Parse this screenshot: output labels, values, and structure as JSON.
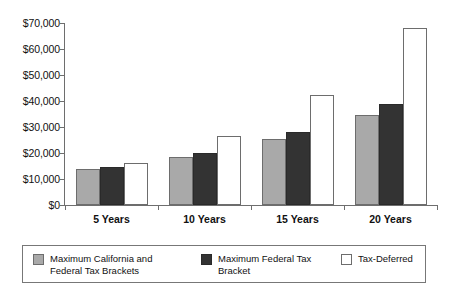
{
  "chart_data": {
    "type": "bar",
    "title": "",
    "subtitle": "",
    "xlabel": "",
    "ylabel": "",
    "categories": [
      "5 Years",
      "10 Years",
      "15 Years",
      "20 Years"
    ],
    "series": [
      {
        "name": "Maximum California and Federal Tax Brackets",
        "color": "#a9a9a9",
        "values": [
          14000,
          18500,
          25500,
          34700
        ]
      },
      {
        "name": "Maximum Federal Tax Bracket",
        "color": "#333333",
        "values": [
          14500,
          20000,
          28000,
          38800
        ]
      },
      {
        "name": "Tax-Deferred",
        "color": "#ffffff",
        "values": [
          16200,
          26500,
          42500,
          68000
        ]
      }
    ],
    "ylim": [
      0,
      70000
    ],
    "ytick_values": [
      0,
      10000,
      20000,
      30000,
      40000,
      50000,
      60000,
      70000
    ],
    "ytick_labels": [
      "$0",
      "$10,000",
      "$20,000",
      "$30,000",
      "$40,000",
      "$50,000",
      "$60,000",
      "$70,000"
    ],
    "grid": false,
    "legend_position": "bottom"
  },
  "legend": {
    "entries": [
      {
        "label": "Maximum California and Federal Tax Brackets",
        "swatch": "gray"
      },
      {
        "label": "Maximum Federal Tax Bracket",
        "swatch": "black"
      },
      {
        "label": "Tax-Deferred",
        "swatch": "white"
      }
    ]
  }
}
